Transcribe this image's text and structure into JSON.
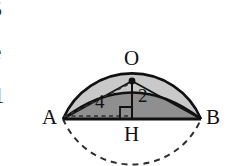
{
  "figure": {
    "name": "circle-with-inscribed-triangle",
    "type": "geometry-diagram",
    "background_color": "#ffffff",
    "stroke_color": "#111111",
    "upper_region_fill": "#c9c9c9",
    "lower_segment_fill": "#8f8f8f",
    "dashed_stroke_color": "#2f2f2f"
  },
  "geometry": {
    "circle": {
      "center_x": 132,
      "center_y": 81,
      "radius": 75
    },
    "chord_AB": {
      "x1": 63,
      "y1": 119,
      "x2": 201,
      "y2": 119
    },
    "foot_H": {
      "x": 132,
      "y": 119
    },
    "center_point_O": {
      "x": 132,
      "y": 81
    },
    "right_angle_mark": {
      "x": 120,
      "y": 107,
      "size": 12
    }
  },
  "labels": {
    "point_O": "O",
    "point_A": "A",
    "point_B": "B",
    "point_H": "H",
    "measure_slant": "4",
    "measure_height": "2"
  },
  "edge_fragments": {
    "fragment_top": "5",
    "fragment_middle": "e",
    "fragment_bottom": "1"
  }
}
